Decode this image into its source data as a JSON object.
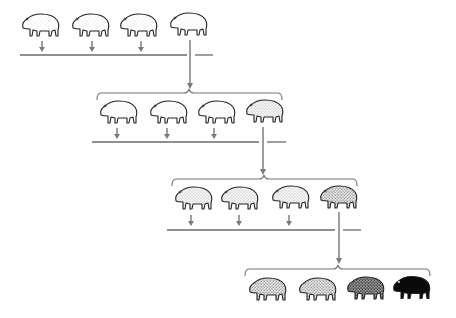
{
  "diagram": {
    "title": "",
    "colors": {
      "line": "#6b6b6b",
      "arrow": "#7a7a7a",
      "outline": "#222222",
      "background": "#ffffff"
    },
    "generations": [
      {
        "index": 1,
        "animals": [
          {
            "shade": "light",
            "fill": "#ffffff",
            "stipple": "#9a9a9a"
          },
          {
            "shade": "light",
            "fill": "#ffffff",
            "stipple": "#9a9a9a"
          },
          {
            "shade": "light",
            "fill": "#ffffff",
            "stipple": "#9a9a9a"
          },
          {
            "shade": "light",
            "fill": "#ffffff",
            "stipple": "#8a8a8a"
          }
        ],
        "selected_index": 3
      },
      {
        "index": 2,
        "animals": [
          {
            "shade": "light",
            "fill": "#ffffff",
            "stipple": "#8a8a8a"
          },
          {
            "shade": "light",
            "fill": "#ffffff",
            "stipple": "#8a8a8a"
          },
          {
            "shade": "light",
            "fill": "#ffffff",
            "stipple": "#8a8a8a"
          },
          {
            "shade": "light-medium",
            "fill": "#f4f4f4",
            "stipple": "#777777"
          }
        ],
        "selected_index": 3
      },
      {
        "index": 3,
        "animals": [
          {
            "shade": "light-medium",
            "fill": "#f4f4f4",
            "stipple": "#777777"
          },
          {
            "shade": "light-medium",
            "fill": "#f4f4f4",
            "stipple": "#777777"
          },
          {
            "shade": "light-medium",
            "fill": "#efefef",
            "stipple": "#707070"
          },
          {
            "shade": "medium",
            "fill": "#e9e9e9",
            "stipple": "#666666"
          }
        ],
        "selected_index": 3
      },
      {
        "index": 4,
        "animals": [
          {
            "shade": "medium",
            "fill": "#e6e6e6",
            "stipple": "#5a5a5a"
          },
          {
            "shade": "medium",
            "fill": "#dedede",
            "stipple": "#555555"
          },
          {
            "shade": "dark",
            "fill": "#9a9a9a",
            "stipple": "#333333"
          },
          {
            "shade": "black",
            "fill": "#0a0a0a",
            "stipple": "#000000"
          }
        ],
        "selected_index": null
      }
    ]
  }
}
